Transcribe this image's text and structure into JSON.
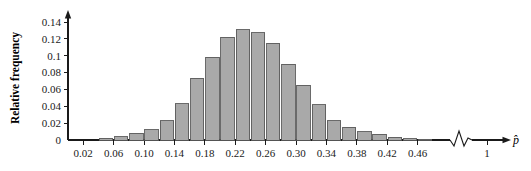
{
  "chart_data": {
    "type": "bar",
    "title": "",
    "subtitle": "",
    "xlabel": "p̂",
    "ylabel": "Relative frequency",
    "xlim": [
      0.0,
      0.5
    ],
    "ylim": [
      0,
      0.145
    ],
    "grid": false,
    "legend": null,
    "bin_width": 0.02,
    "x_tick_labels": [
      "0.02",
      "0.06",
      "0.10",
      "0.14",
      "0.18",
      "0.22",
      "0.26",
      "0.30",
      "0.34",
      "0.38",
      "0.42",
      "0.46",
      "1"
    ],
    "x_tick_values": [
      0.02,
      0.06,
      0.1,
      0.14,
      0.18,
      0.22,
      0.26,
      0.3,
      0.34,
      0.38,
      0.42,
      0.46,
      1.0
    ],
    "y_tick_labels": [
      "0",
      "0.02",
      "0.04",
      "0.06",
      "0.08",
      "0.1",
      "0.12",
      "0.14"
    ],
    "y_tick_values": [
      0,
      0.02,
      0.04,
      0.06,
      0.08,
      0.1,
      0.12,
      0.14
    ],
    "axis_break": true,
    "axis_break_note": "zigzag break between 0.48 and 1 on the horizontal axis",
    "bar_fill_color": "#a9a9a9",
    "bar_edge_color": "#5a5a5a",
    "axis_color": "#1a1a1a",
    "categories": [
      "0.04-0.06",
      "0.06-0.08",
      "0.08-0.10",
      "0.10-0.12",
      "0.12-0.14",
      "0.14-0.16",
      "0.16-0.18",
      "0.18-0.20",
      "0.20-0.22",
      "0.22-0.24",
      "0.24-0.26",
      "0.26-0.28",
      "0.28-0.30",
      "0.30-0.32",
      "0.32-0.34",
      "0.34-0.36",
      "0.36-0.38",
      "0.38-0.40",
      "0.40-0.42",
      "0.42-0.44",
      "0.44-0.46",
      "0.46-0.48"
    ],
    "bin_starts": [
      0.04,
      0.06,
      0.08,
      0.1,
      0.12,
      0.14,
      0.16,
      0.18,
      0.2,
      0.22,
      0.24,
      0.26,
      0.28,
      0.3,
      0.32,
      0.34,
      0.36,
      0.38,
      0.4,
      0.42,
      0.44,
      0.46
    ],
    "values": [
      0.002,
      0.004,
      0.008,
      0.012,
      0.023,
      0.043,
      0.073,
      0.098,
      0.122,
      0.131,
      0.127,
      0.115,
      0.09,
      0.065,
      0.042,
      0.023,
      0.015,
      0.01,
      0.007,
      0.003,
      0.0015,
      0.001
    ]
  }
}
